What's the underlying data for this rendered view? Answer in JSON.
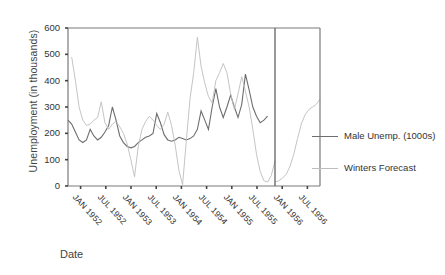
{
  "chart_data": {
    "type": "line",
    "title": "",
    "xlabel": "Date",
    "ylabel": "Unemployment (in thousands)",
    "ylim": [
      0,
      600
    ],
    "yticks": [
      0,
      100,
      200,
      300,
      400,
      500,
      600
    ],
    "xticks": [
      "JAN 1952",
      "JUL 1952",
      "JAN 1953",
      "JUL 1953",
      "JAN 1954",
      "JUL 1954",
      "JAN 1955",
      "JUL 1955",
      "JAN 1956",
      "JUL 1956"
    ],
    "grid": false,
    "legend_position": "right",
    "forecast_divider_label": "JAN 1956",
    "x": [
      "JAN 1952",
      "FEB 1952",
      "MAR 1952",
      "APR 1952",
      "MAY 1952",
      "JUN 1952",
      "JUL 1952",
      "AUG 1952",
      "SEP 1952",
      "OCT 1952",
      "NOV 1952",
      "DEC 1952",
      "JAN 1953",
      "FEB 1953",
      "MAR 1953",
      "APR 1953",
      "MAY 1953",
      "JUN 1953",
      "JUL 1953",
      "AUG 1953",
      "SEP 1953",
      "OCT 1953",
      "NOV 1953",
      "DEC 1953",
      "JAN 1954",
      "FEB 1954",
      "MAR 1954",
      "APR 1954",
      "MAY 1954",
      "JUN 1954",
      "JUL 1954",
      "AUG 1954",
      "SEP 1954",
      "OCT 1954",
      "NOV 1954",
      "DEC 1954",
      "JAN 1955",
      "FEB 1955",
      "MAR 1955",
      "APR 1955",
      "MAY 1955",
      "JUN 1955",
      "JUL 1955",
      "AUG 1955",
      "SEP 1955",
      "OCT 1955",
      "NOV 1955",
      "DEC 1955",
      "JAN 1956",
      "FEB 1956",
      "MAR 1956",
      "APR 1956",
      "MAY 1956",
      "JUN 1956",
      "JUL 1956",
      "AUG 1956",
      "SEP 1956"
    ],
    "series": [
      {
        "name": "Male Unemp. (1000s)",
        "color": "#6e6e6e",
        "values": [
          250,
          235,
          205,
          175,
          165,
          175,
          215,
          190,
          175,
          185,
          205,
          230,
          300,
          250,
          190,
          165,
          150,
          145,
          150,
          165,
          175,
          185,
          190,
          200,
          275,
          240,
          195,
          175,
          170,
          175,
          185,
          180,
          175,
          180,
          190,
          215,
          285,
          250,
          215,
          300,
          370,
          300,
          260,
          300,
          345,
          300,
          260,
          310,
          425,
          365,
          300,
          265,
          240,
          250,
          265,
          null,
          null
        ]
      },
      {
        "name": "Winters Forecast",
        "color": "#bdbdbd",
        "values": [
          null,
          490,
          400,
          300,
          250,
          230,
          235,
          250,
          260,
          320,
          240,
          215,
          235,
          245,
          225,
          200,
          160,
          100,
          35,
          150,
          215,
          245,
          265,
          250,
          230,
          215,
          235,
          280,
          230,
          155,
          60,
          5,
          170,
          330,
          430,
          565,
          455,
          390,
          340,
          315,
          400,
          430,
          465,
          430,
          350,
          290,
          350,
          415,
          360,
          300,
          215,
          120,
          55,
          20,
          15,
          40,
          95
        ]
      }
    ],
    "forecast_tail": {
      "name": "Winters Forecast",
      "color": "#bdbdbd",
      "values": [
        15,
        20,
        30,
        45,
        75,
        120,
        180,
        235,
        270,
        290,
        300,
        310,
        330
      ]
    }
  },
  "legend": {
    "items": [
      {
        "label": "Male Unemp. (1000s)",
        "color": "#6e6e6e"
      },
      {
        "label": "Winters Forecast",
        "color": "#bdbdbd"
      }
    ]
  },
  "axes": {
    "y_title": "Unemployment (in thousands)",
    "x_title": "Date"
  }
}
